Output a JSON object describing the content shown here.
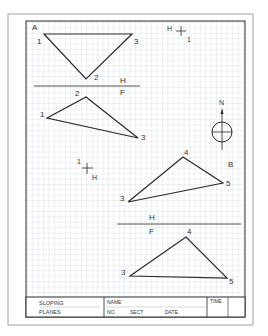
{
  "worksheet": {
    "colors": {
      "paper": "#ffffff",
      "grid": "#b8cbe0",
      "grid_major": "#a3bad4",
      "ink": "#2a2a2a",
      "outer_frame": "#8a8a8a"
    },
    "views": {
      "top_view_A": {
        "view_label": "A",
        "points": [
          {
            "label": "1",
            "x": 36,
            "y": 42
          },
          {
            "label": "2",
            "x": 86,
            "y": 79
          },
          {
            "label": "3",
            "x": 132,
            "y": 34
          }
        ]
      },
      "front_view_2F": {
        "points": [
          {
            "label": "1",
            "x": 47,
            "y": 118
          },
          {
            "label": "2",
            "x": 86,
            "y": 97
          },
          {
            "label": "3",
            "x": 138,
            "y": 138
          }
        ]
      },
      "top_view_B": {
        "view_label": "B",
        "points": [
          {
            "label": "3",
            "x": 128,
            "y": 202
          },
          {
            "label": "4",
            "x": 183,
            "y": 157
          },
          {
            "label": "5",
            "x": 223,
            "y": 183
          }
        ]
      },
      "front_view_B": {
        "points": [
          {
            "label": "3",
            "x": 130,
            "y": 276
          },
          {
            "label": "4",
            "x": 186,
            "y": 237
          },
          {
            "label": "5",
            "x": 227,
            "y": 278
          }
        ]
      }
    },
    "fold_lines": [
      {
        "top_label": "H",
        "bottom_label": "F",
        "y": 86
      },
      {
        "top_label": "H",
        "bottom_label": "F",
        "y": 224
      }
    ],
    "reference_marks": [
      {
        "label_1": "H",
        "label_2": "1"
      },
      {
        "label_1": "1",
        "label_2": "H"
      }
    ],
    "north_arrow": {
      "label": "N"
    },
    "title_block": {
      "title_line1": "SLOPING",
      "title_line2": "PLANES",
      "name_label": "NAME",
      "no_label": "NO.",
      "sect_label": "SECT",
      "date_label": "DATE",
      "time_label": "TIME"
    }
  }
}
